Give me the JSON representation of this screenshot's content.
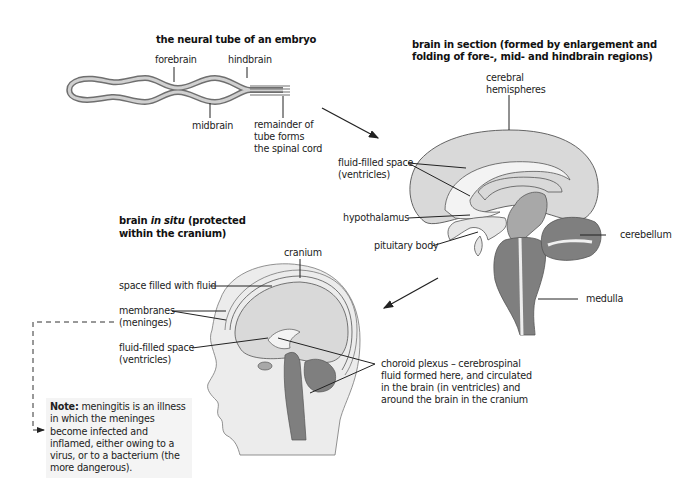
{
  "diagram": {
    "neural_tube": {
      "title": "the neural tube of an embryo",
      "labels": {
        "forebrain": "forebrain",
        "hindbrain": "hindbrain",
        "midbrain": "midbrain",
        "remainder_1": "remainder of",
        "remainder_2": "tube forms",
        "remainder_3": "the spinal cord"
      }
    },
    "brain_section": {
      "title_line1": "brain in section (formed by enlargement and",
      "title_line2": "folding of fore-, mid- and hindbrain regions)",
      "labels": {
        "cerebral_1": "cerebral",
        "cerebral_2": "hemispheres",
        "ventricles_1": "fluid-filled space",
        "ventricles_2": "(ventricles)",
        "hypothalamus": "hypothalamus",
        "pituitary": "pituitary body",
        "cerebellum": "cerebellum",
        "medulla": "medulla"
      }
    },
    "brain_in_situ": {
      "title_part1": "brain ",
      "title_italic": "in situ",
      "title_part2": " (protected",
      "title_line2": "within the cranium)",
      "labels": {
        "cranium": "cranium",
        "fluid_space": "space filled with fluid",
        "membranes_1": "membranes",
        "membranes_2": "(meninges)",
        "ventricles_1": "fluid-filled space",
        "ventricles_2": "(ventricles)",
        "choroid_1": "choroid plexus – cerebrospinal",
        "choroid_2": "fluid formed here, and circulated",
        "choroid_3": "in the brain (in ventricles) and",
        "choroid_4": "around the brain in the cranium"
      }
    },
    "note": {
      "bold": "Note:",
      "text": " meningitis is an illness in which the meninges become infected and inflamed, either owing to a virus, or to a bacterium (the more dangerous)."
    },
    "colors": {
      "cerebrum_fill": "#d9d9d9",
      "brainstem_fill": "#7f7f7f",
      "midbrain_fill": "#a8a8a8",
      "skin_fill": "#ececec",
      "outline": "#555555"
    }
  }
}
